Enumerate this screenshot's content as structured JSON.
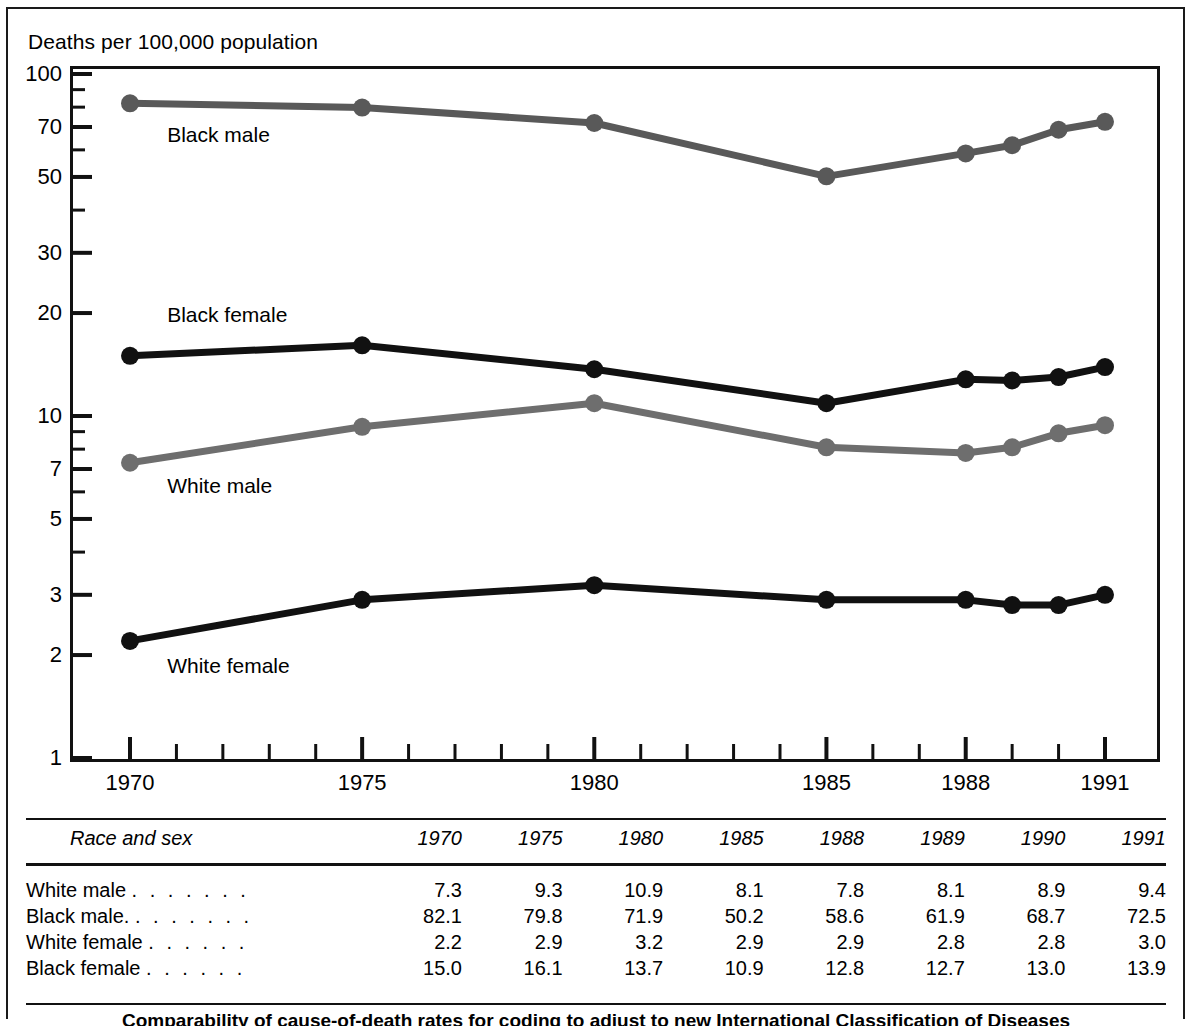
{
  "axis_title": "Deaths per 100,000 population",
  "footnote_partial": "Comparability of cause-of-death rates for coding to adjust to new International Classification of Diseases",
  "colors": {
    "black_male_line": "#595959",
    "black_female_line": "#111111",
    "white_male_line": "#6e6e6e",
    "white_female_line": "#111111",
    "axis": "#111111"
  },
  "chart_data": {
    "type": "line",
    "title": "Deaths per 100,000 population",
    "xlabel": "",
    "ylabel": "Deaths per 100,000 population",
    "yscale": "log",
    "ylim": [
      1,
      100
    ],
    "xlim": [
      1970,
      1991
    ],
    "grid": false,
    "legend": "inline-labels",
    "ytick_labels": [
      "100",
      "70",
      "50",
      "30",
      "20",
      "10",
      "7",
      "5",
      "3",
      "2",
      "1"
    ],
    "ytick_values": [
      100,
      70,
      50,
      30,
      20,
      10,
      7,
      5,
      3,
      2,
      1
    ],
    "xtick_labels": [
      "1970",
      "1975",
      "1980",
      "1985",
      "1988",
      "1991"
    ],
    "xtick_values": [
      1970,
      1975,
      1980,
      1985,
      1988,
      1991
    ],
    "x": [
      1970,
      1975,
      1980,
      1985,
      1988,
      1989,
      1990,
      1991
    ],
    "series": [
      {
        "name": "Black male",
        "values": [
          82.1,
          79.8,
          71.9,
          50.2,
          58.6,
          61.9,
          68.7,
          72.5
        ],
        "color": "#595959",
        "label_x": 1970.8,
        "label_y": 66.0
      },
      {
        "name": "Black female",
        "values": [
          15.0,
          16.1,
          13.7,
          10.9,
          12.8,
          12.7,
          13.0,
          13.9
        ],
        "color": "#111111",
        "label_x": 1970.8,
        "label_y": 19.6
      },
      {
        "name": "White male",
        "values": [
          7.3,
          9.3,
          10.9,
          8.1,
          7.8,
          8.1,
          8.9,
          9.4
        ],
        "color": "#6e6e6e",
        "label_x": 1970.8,
        "label_y": 6.2
      },
      {
        "name": "White female",
        "values": [
          2.2,
          2.9,
          3.2,
          2.9,
          2.9,
          2.8,
          2.8,
          3.0
        ],
        "color": "#111111",
        "label_x": 1970.8,
        "label_y": 1.85
      }
    ]
  },
  "table": {
    "header": {
      "row_label": "Race and sex",
      "years": [
        "1970",
        "1975",
        "1980",
        "1985",
        "1988",
        "1989",
        "1990",
        "1991"
      ]
    },
    "rows": [
      {
        "label": "White male",
        "leader": ". . . . . . .",
        "values": [
          "7.3",
          "9.3",
          "10.9",
          "8.1",
          "7.8",
          "8.1",
          "8.9",
          "9.4"
        ]
      },
      {
        "label": "Black male.",
        "leader": ". . . . . . .",
        "values": [
          "82.1",
          "79.8",
          "71.9",
          "50.2",
          "58.6",
          "61.9",
          "68.7",
          "72.5"
        ]
      },
      {
        "label": "White female",
        "leader": ". . . . . .",
        "values": [
          "2.2",
          "2.9",
          "3.2",
          "2.9",
          "2.9",
          "2.8",
          "2.8",
          "3.0"
        ]
      },
      {
        "label": "Black female",
        "leader": ". . . . . .",
        "values": [
          "15.0",
          "16.1",
          "13.7",
          "10.9",
          "12.8",
          "12.7",
          "13.0",
          "13.9"
        ]
      }
    ]
  }
}
